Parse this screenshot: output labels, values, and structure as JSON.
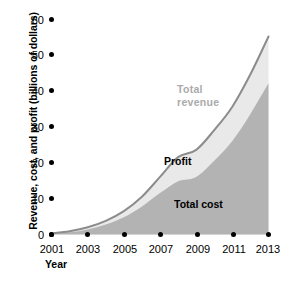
{
  "chart_data": {
    "type": "area",
    "title": "",
    "subtitle": "",
    "xlabel": "Year",
    "ylabel": "Revenue, cost, and profit (billions of dollars)",
    "x": [
      2001,
      2002,
      2003,
      2004,
      2005,
      2006,
      2007,
      2008,
      2009,
      2010,
      2011,
      2012,
      2013
    ],
    "xlim": [
      2001,
      2013
    ],
    "ylim": [
      0,
      60
    ],
    "xticks": [
      "2001",
      "2003",
      "2005",
      "2007",
      "2009",
      "2011",
      "2013"
    ],
    "yticks": [
      "0",
      "10",
      "20",
      "30",
      "40",
      "50",
      "60"
    ],
    "grid": false,
    "legend_position": "inline-annotations",
    "stacking": "total revenue = total cost + profit",
    "series": [
      {
        "name": "Total revenue",
        "color": "#8c8c8c",
        "fill": "#e9e9e9",
        "values": [
          0.3,
          0.9,
          2.0,
          3.8,
          6.5,
          10.5,
          16.0,
          21.5,
          23.5,
          29.0,
          35.5,
          44.5,
          55.0
        ]
      },
      {
        "name": "Total cost",
        "color": "#b3b3b3",
        "fill": "#b3b3b3",
        "values": [
          0.2,
          0.6,
          1.4,
          2.8,
          4.8,
          7.8,
          11.5,
          14.8,
          16.0,
          20.5,
          26.0,
          33.5,
          42.0
        ]
      },
      {
        "name": "Profit",
        "color": "#e9e9e9",
        "fill": "#e9e9e9",
        "values": [
          0.1,
          0.3,
          0.6,
          1.0,
          1.7,
          2.7,
          4.5,
          6.7,
          7.5,
          8.5,
          9.5,
          11.0,
          13.0
        ]
      }
    ],
    "annotations": [
      {
        "text": "Total revenue",
        "series": "Total revenue"
      },
      {
        "text": "Profit",
        "series": "Profit"
      },
      {
        "text": "Total cost",
        "series": "Total cost"
      }
    ]
  },
  "axes": {
    "y_title": "Revenue, cost, and profit (billions of dollars)",
    "x_title": "Year",
    "y_labels": [
      "60",
      "50",
      "40",
      "30",
      "20",
      "10",
      "0"
    ],
    "x_labels": [
      "2001",
      "2003",
      "2005",
      "2007",
      "2009",
      "2011",
      "2013"
    ]
  },
  "labels": {
    "total_revenue_line1": "Total",
    "total_revenue_line2": "revenue",
    "profit": "Profit",
    "total_cost": "Total cost"
  },
  "colors": {
    "total_cost_fill": "#b3b3b3",
    "profit_fill": "#e9e9e9",
    "revenue_stroke": "#8c8c8c",
    "tick_color": "#000000",
    "revenue_label_color": "#aaaaaa",
    "background": "#ffffff"
  }
}
